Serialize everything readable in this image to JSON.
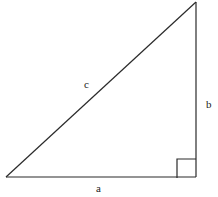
{
  "diagram": {
    "colors": {
      "stroke": "#2a2a2a",
      "text": "#222222",
      "background": "#ffffff"
    },
    "vertices": {
      "bottom_left": [
        6,
        177
      ],
      "bottom_right": [
        196,
        177
      ],
      "top": [
        196,
        2
      ]
    },
    "right_angle_marker": {
      "x": 177,
      "y": 159,
      "size": 19
    },
    "labels": {
      "hypotenuse": {
        "text": "c",
        "x": 84,
        "y": 88
      },
      "vertical_leg": {
        "text": "b",
        "x": 206,
        "y": 108
      },
      "horizontal_leg": {
        "text": "a",
        "x": 96,
        "y": 192
      }
    }
  }
}
